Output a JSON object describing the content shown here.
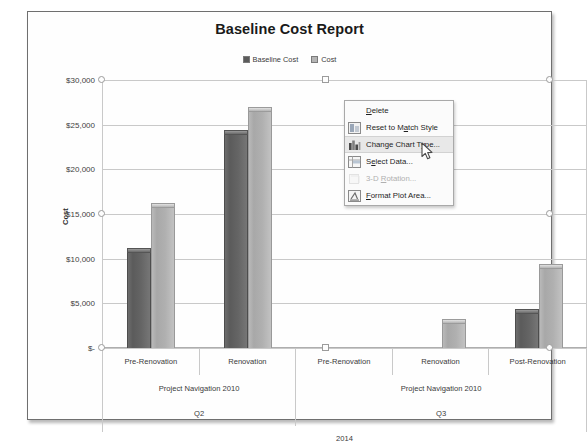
{
  "chart_data": {
    "type": "bar",
    "title": "Baseline Cost Report",
    "xlabel": "",
    "ylabel": "Cost",
    "ylim": [
      0,
      30000
    ],
    "ytick_labels": [
      "$30,000",
      "$25,000",
      "$20,000",
      "$15,000",
      "$10,000",
      "$5,000",
      "$-"
    ],
    "ytick_values": [
      30000,
      25000,
      20000,
      15000,
      10000,
      5000,
      0
    ],
    "grid": true,
    "legend_position": "top",
    "categories": [
      "Pre-Renovation",
      "Renovation",
      "Pre-Renovation",
      "Renovation",
      "Post-Renovation"
    ],
    "series": [
      {
        "name": "Baseline Cost",
        "color": "#5b5b5b",
        "values": [
          11200,
          24400,
          0,
          0,
          4400
        ]
      },
      {
        "name": "Cost",
        "color": "#b0b0b0",
        "values": [
          16200,
          27000,
          0,
          3200,
          9400
        ]
      }
    ],
    "axis_groups": {
      "level2": [
        {
          "label": "Project Navigation 2010",
          "span": 2
        },
        {
          "label": "Project Navigation 2010",
          "span": 3
        }
      ],
      "level3": [
        {
          "label": "Q2",
          "span": 2
        },
        {
          "label": "Q3",
          "span": 3
        }
      ],
      "level4": [
        {
          "label": "2014",
          "span": 5
        }
      ]
    }
  },
  "chart": {
    "title": "Baseline Cost Report",
    "y_axis_title": "Cost",
    "legend": [
      {
        "label": "Baseline Cost",
        "swatch": "#5b5b5b"
      },
      {
        "label": "Cost",
        "swatch": "#b4b4b4"
      }
    ]
  },
  "context_menu": {
    "items": [
      {
        "label": "Delete",
        "accel": "D",
        "icon": "none",
        "state": "normal"
      },
      {
        "label": "Reset to Match Style",
        "accel": "a",
        "icon": "reset-style-icon",
        "state": "normal"
      },
      {
        "label": "Change Chart Type...",
        "accel": "y",
        "icon": "chart-type-icon",
        "state": "highlight"
      },
      {
        "label": "Select Data...",
        "accel": "e",
        "icon": "select-data-icon",
        "state": "normal"
      },
      {
        "label": "3-D Rotation...",
        "accel": "R",
        "icon": "rotation-3d-icon",
        "state": "disabled"
      },
      {
        "label": "Format Plot Area...",
        "accel": "F",
        "icon": "format-area-icon",
        "state": "normal"
      }
    ]
  }
}
